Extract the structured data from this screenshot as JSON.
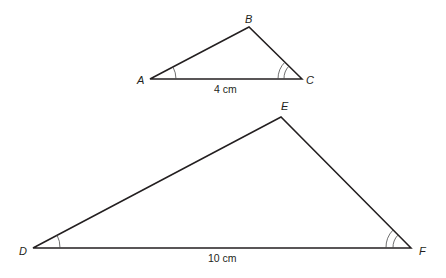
{
  "diagram": {
    "type": "similar-triangles",
    "triangles": [
      {
        "name": "ABC",
        "vertices": {
          "A": {
            "label": "A",
            "x": 150,
            "y": 79
          },
          "B": {
            "label": "B",
            "x": 249,
            "y": 27
          },
          "C": {
            "label": "C",
            "x": 302,
            "y": 79
          }
        },
        "base_label": "4 cm",
        "angle_marks": {
          "A": "single",
          "C": "double"
        }
      },
      {
        "name": "DEF",
        "vertices": {
          "D": {
            "label": "D",
            "x": 33,
            "y": 248
          },
          "E": {
            "label": "E",
            "x": 281,
            "y": 117
          },
          "F": {
            "label": "F",
            "x": 411,
            "y": 248
          }
        },
        "base_label": "10 cm",
        "angle_marks": {
          "D": "single",
          "F": "double"
        }
      }
    ]
  }
}
